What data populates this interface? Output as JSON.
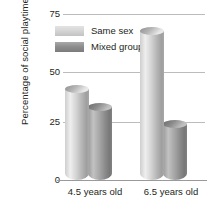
{
  "chart_data": {
    "type": "bar",
    "title": "",
    "xlabel": "",
    "ylabel": "Percentage of social playtime",
    "categories": [
      "4.5 years old",
      "6.5 years old"
    ],
    "series": [
      {
        "name": "Same sex",
        "values": [
          43,
          69
        ]
      },
      {
        "name": "Mixed group",
        "values": [
          35,
          27
        ]
      }
    ],
    "ylim": [
      0,
      75
    ],
    "yticks": [
      75,
      50,
      25,
      0
    ],
    "ytick_labels": [
      "75",
      "50",
      "25",
      "0"
    ],
    "grid": true,
    "legend_position": "top-left-inside",
    "colors": {
      "same_sex": "#d6d6d6",
      "mixed_group": "#8e8e8e",
      "gridline": "#bcbcbc",
      "axis": "#9a9a9a",
      "text": "#231f20",
      "background": "#ffffff"
    }
  },
  "axis": {
    "y_title": "Percentage of social playtime",
    "y_tick_0": "75",
    "y_tick_1": "50",
    "y_tick_2": "25",
    "y_tick_3": "0",
    "x_tick_0": "4.5 years old",
    "x_tick_1": "6.5 years old"
  },
  "legend": {
    "items": [
      {
        "label": "Same sex"
      },
      {
        "label": "Mixed group"
      }
    ]
  }
}
